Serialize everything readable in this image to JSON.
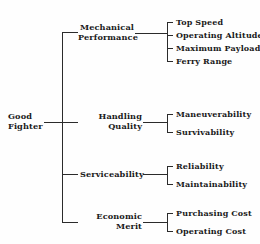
{
  "diagram": {
    "type": "hierarchy-tree",
    "orientation": "left-to-right",
    "line_color": "#2b2b2b",
    "text_color": "#1a1a1a",
    "background_color": "#fefefe",
    "root": {
      "label": "Good Fighter",
      "line1": "Good",
      "line2": "Fighter"
    },
    "categories": [
      {
        "label": "Mechanical Performance",
        "line1": "Mechanical",
        "line2": "Performance",
        "leaves": [
          {
            "label": "Top Speed"
          },
          {
            "label": "Operating Altitude"
          },
          {
            "label": "Maximum Payload"
          },
          {
            "label": "Ferry Range"
          }
        ]
      },
      {
        "label": "Handling Quality",
        "line1": "Handling",
        "line2": "Quality",
        "leaves": [
          {
            "label": "Maneuverability"
          },
          {
            "label": "Survivability"
          }
        ]
      },
      {
        "label": "Serviceability",
        "line1": "Serviceability",
        "line2": "",
        "leaves": [
          {
            "label": "Reliability"
          },
          {
            "label": "Maintainability"
          }
        ]
      },
      {
        "label": "Economic Merit",
        "line1": "Economic",
        "line2": "Merit",
        "leaves": [
          {
            "label": "Purchasing Cost"
          },
          {
            "label": "Operating Cost"
          }
        ]
      }
    ]
  }
}
